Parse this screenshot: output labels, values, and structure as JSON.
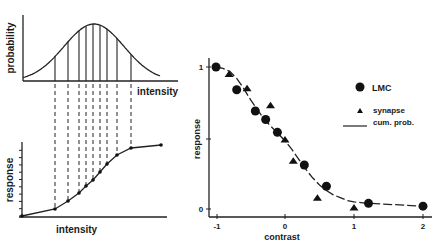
{
  "chart_data": [
    {
      "id": "probability-plot",
      "type": "line",
      "title": "",
      "xlabel": "intensity",
      "ylabel": "probability",
      "description": "Gaussian probability distribution of intensity with vertical lines dividing it into equal-probability slices",
      "grid": false,
      "peak_intensity_fraction": 0.52,
      "slice_positions_px": [
        55,
        68,
        79,
        86,
        93,
        100,
        107,
        117,
        131
      ]
    },
    {
      "id": "response-intensity-plot",
      "type": "line",
      "title": "",
      "xlabel": "intensity",
      "ylabel": "response",
      "description": "Sigmoidal cumulative response curve; dashed projections from probability slices map to equally spaced response levels",
      "grid": false,
      "y_ticks": 10,
      "points_px": [
        [
          22,
          216
        ],
        [
          55,
          209
        ],
        [
          68,
          201
        ],
        [
          79,
          193
        ],
        [
          86,
          186
        ],
        [
          93,
          180
        ],
        [
          100,
          172
        ],
        [
          107,
          164
        ],
        [
          117,
          155
        ],
        [
          131,
          148
        ],
        [
          161,
          145
        ]
      ]
    },
    {
      "id": "response-contrast-plot",
      "type": "scatter",
      "title": "",
      "xlabel": "contrast",
      "ylabel": "response",
      "xlim": [
        -1.05,
        2.05
      ],
      "ylim": [
        0,
        1
      ],
      "x_ticks": [
        "-1",
        "0",
        "1",
        "2"
      ],
      "y_ticks": [
        "0",
        "1"
      ],
      "grid": false,
      "legend_position": "upper right",
      "series": [
        {
          "name": "LMC",
          "marker": "circle",
          "x": [
            -1.0,
            -0.7,
            -0.43,
            -0.28,
            -0.11,
            0.28,
            0.6,
            1.21,
            2.0
          ],
          "y": [
            1.0,
            0.84,
            0.69,
            0.63,
            0.54,
            0.31,
            0.16,
            0.04,
            0.02
          ]
        },
        {
          "name": "synapse",
          "marker": "triangle",
          "x": [
            -0.81,
            -0.55,
            -0.21,
            0.0,
            0.12,
            0.47,
            1.0
          ],
          "y": [
            0.95,
            0.85,
            0.73,
            0.49,
            0.34,
            0.08,
            0.01
          ]
        },
        {
          "name": "cum. prob.",
          "marker": "line",
          "x": [
            -1.0,
            -0.9,
            -0.8,
            -0.7,
            -0.6,
            -0.5,
            -0.4,
            -0.3,
            -0.2,
            -0.1,
            0.0,
            0.1,
            0.2,
            0.3,
            0.4,
            0.5,
            0.6,
            0.7,
            0.8,
            0.9,
            1.0,
            1.1,
            1.2,
            1.6,
            2.0
          ],
          "y": [
            1.0,
            0.99,
            0.97,
            0.92,
            0.85,
            0.77,
            0.7,
            0.63,
            0.58,
            0.53,
            0.48,
            0.42,
            0.35,
            0.28,
            0.22,
            0.17,
            0.13,
            0.1,
            0.08,
            0.06,
            0.05,
            0.045,
            0.04,
            0.03,
            0.02
          ]
        }
      ]
    }
  ],
  "labels": {
    "prob_ylabel": "probability",
    "prob_xlabel": "intensity",
    "resp_ylabel": "response",
    "resp_xlabel": "intensity",
    "right_ylabel": "response",
    "right_xlabel": "contrast",
    "x_tick_neg1": "-1",
    "x_tick_0": "0",
    "x_tick_1": "1",
    "x_tick_2": "2",
    "y_tick_0": "0",
    "y_tick_1": "1",
    "legend_lmc": "LMC",
    "legend_synapse": "synapse",
    "legend_cum": "cum. prob."
  }
}
